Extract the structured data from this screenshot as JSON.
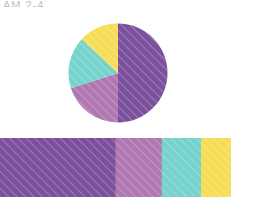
{
  "figure": {
    "caption_sliver": "AM 2-4",
    "background": "#ffffff"
  },
  "palette": {
    "purple": "#7B519D",
    "magenta": "#B077B0",
    "teal": "#76D2CC",
    "yellow": "#F7DC55",
    "hatch": "#ffffff"
  },
  "chart_data": [
    {
      "type": "pie",
      "title": "",
      "categories": [
        "Category 1",
        "Category 2",
        "Category 3",
        "Category 4"
      ],
      "values": [
        50,
        20,
        17,
        13
      ],
      "units": "percent",
      "colors": [
        "#7B519D",
        "#B077B0",
        "#76D2CC",
        "#F7DC55"
      ],
      "start_angle_deg": 0,
      "direction": "clockwise",
      "hatched": true,
      "hatch_pattern": "diagonal",
      "legend": "none",
      "labels_shown": false,
      "slices": [
        {
          "label": "Category 1",
          "value": 50,
          "color": "#7B519D",
          "start_deg": 0,
          "end_deg": 180
        },
        {
          "label": "Category 2",
          "value": 20,
          "color": "#B077B0",
          "start_deg": 180,
          "end_deg": 252
        },
        {
          "label": "Category 3",
          "value": 17,
          "color": "#76D2CC",
          "start_deg": 252,
          "end_deg": 313
        },
        {
          "label": "Category 4",
          "value": 13,
          "color": "#F7DC55",
          "start_deg": 313,
          "end_deg": 360
        }
      ]
    },
    {
      "type": "bar",
      "subtype": "stacked-horizontal",
      "title": "",
      "xlabel": "",
      "ylabel": "",
      "categories": [
        "Category 1",
        "Category 2",
        "Category 3",
        "Category 4"
      ],
      "values": [
        50,
        20,
        17,
        13
      ],
      "units": "percent",
      "colors": [
        "#7B519D",
        "#B077B0",
        "#76D2CC",
        "#F7DC55"
      ],
      "xlim": [
        0,
        100
      ],
      "grid": false,
      "axis_visible": false,
      "tick_labels_shown": false,
      "legend": "none",
      "hatched": true,
      "hatch_pattern": "diagonal",
      "segments": [
        {
          "label": "Category 1",
          "value": 50,
          "color": "#7B519D",
          "start_pct": 0,
          "end_pct": 50
        },
        {
          "label": "Category 2",
          "value": 20,
          "color": "#B077B0",
          "start_pct": 50,
          "end_pct": 70
        },
        {
          "label": "Category 3",
          "value": 17,
          "color": "#76D2CC",
          "start_pct": 70,
          "end_pct": 87
        },
        {
          "label": "Category 4",
          "value": 13,
          "color": "#F7DC55",
          "start_pct": 87,
          "end_pct": 100
        }
      ]
    }
  ]
}
